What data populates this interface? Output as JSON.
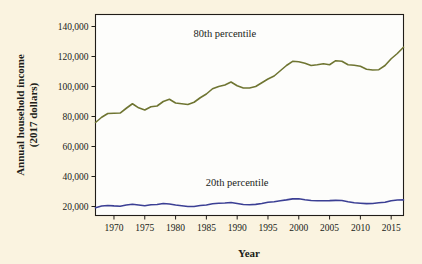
{
  "chart_data": {
    "type": "line",
    "title": "",
    "xlabel": "Year",
    "ylabel": "Annual household income\n(2017 dollars)",
    "ylabel_line1": "Annual household income",
    "ylabel_line2": "(2017 dollars)",
    "xlim": [
      1967,
      2017
    ],
    "ylim": [
      14000,
      148000
    ],
    "grid": false,
    "legend_position": "inline-annotation",
    "xticks": [
      1970,
      1975,
      1980,
      1985,
      1990,
      1995,
      2000,
      2005,
      2010,
      2015
    ],
    "xtick_labels": [
      "1970",
      "1975",
      "1980",
      "1985",
      "1990",
      "1995",
      "2000",
      "2005",
      "2010",
      "2015"
    ],
    "yticks": [
      20000,
      40000,
      60000,
      80000,
      100000,
      120000,
      140000
    ],
    "ytick_labels": [
      "20,000",
      "40,000",
      "60,000",
      "80,000",
      "100,000",
      "120,000",
      "140,000"
    ],
    "x": [
      1967,
      1968,
      1969,
      1970,
      1971,
      1972,
      1973,
      1974,
      1975,
      1976,
      1977,
      1978,
      1979,
      1980,
      1981,
      1982,
      1983,
      1984,
      1985,
      1986,
      1987,
      1988,
      1989,
      1990,
      1991,
      1992,
      1993,
      1994,
      1995,
      1996,
      1997,
      1998,
      1999,
      2000,
      2001,
      2002,
      2003,
      2004,
      2005,
      2006,
      2007,
      2008,
      2009,
      2010,
      2011,
      2012,
      2013,
      2014,
      2015,
      2016,
      2017
    ],
    "series": [
      {
        "name": "80th percentile",
        "label": "80th percentile",
        "color": "#6f7532",
        "label_x": 1988,
        "label_y": 133000,
        "values": [
          76000,
          79500,
          82000,
          82200,
          82300,
          85500,
          88500,
          85800,
          84300,
          86500,
          87000,
          90000,
          91500,
          89000,
          88500,
          88000,
          89500,
          92500,
          95000,
          98500,
          100000,
          101000,
          103000,
          100500,
          99000,
          99000,
          100000,
          102500,
          105000,
          107000,
          110500,
          114000,
          116800,
          116500,
          115500,
          114000,
          114500,
          115200,
          114500,
          117200,
          116800,
          114500,
          114200,
          113500,
          111500,
          111000,
          111200,
          114000,
          118500,
          122000,
          126200
        ]
      },
      {
        "name": "20th percentile",
        "label": "20th percentile",
        "color": "#3b3f94",
        "label_x": 1990,
        "label_y": 33500,
        "values": [
          19200,
          20300,
          20700,
          20400,
          20200,
          21000,
          21500,
          21000,
          20500,
          21200,
          21300,
          22000,
          21700,
          21000,
          20500,
          20000,
          20000,
          20700,
          21000,
          21800,
          22200,
          22300,
          22700,
          22000,
          21300,
          21200,
          21400,
          22000,
          22800,
          23200,
          23800,
          24400,
          25100,
          25200,
          24500,
          24000,
          23800,
          23800,
          23900,
          24100,
          24000,
          23200,
          22500,
          22200,
          21900,
          22000,
          22500,
          22800,
          23800,
          24300,
          24400
        ]
      }
    ]
  }
}
